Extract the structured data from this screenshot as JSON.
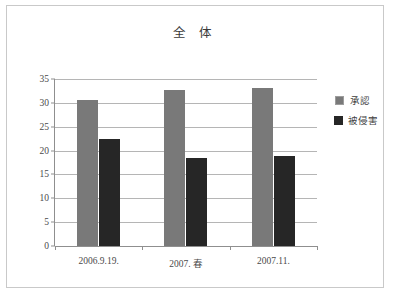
{
  "chart_data": {
    "type": "bar",
    "title": "全 体",
    "xlabel": "",
    "ylabel": "",
    "ylim": [
      0,
      35
    ],
    "yticks": [
      0,
      5,
      10,
      15,
      20,
      25,
      30,
      35
    ],
    "grid": true,
    "legend_position": "right",
    "categories": [
      "2006.9.19.",
      "2007. 春",
      "2007.11."
    ],
    "series": [
      {
        "name": "承認",
        "color": "#797979",
        "values": [
          30.5,
          32.8,
          33.2
        ]
      },
      {
        "name": "被侵害",
        "color": "#262626",
        "values": [
          22.5,
          18.4,
          18.9
        ]
      }
    ]
  },
  "frame": {
    "border_color": "#c9c9c9",
    "background": "#ffffff"
  }
}
